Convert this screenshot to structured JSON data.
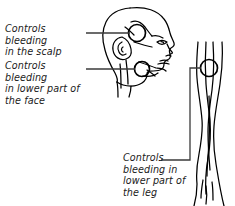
{
  "figure": {
    "ink_color": "#000000",
    "text_color": "#1a1a1a",
    "background": "#ffffff"
  },
  "callouts": [
    {
      "id": "scalp",
      "text": "Controls bleeding\nin the scalp",
      "target": "temporal-pressure-point"
    },
    {
      "id": "face",
      "text": "Controls bleeding\nin lower part of\nthe face",
      "target": "facial-pressure-point"
    },
    {
      "id": "leg",
      "text": "Controls\nbleeding in\nlower part of\nthe leg",
      "target": "popliteal-pressure-point"
    }
  ],
  "markers": [
    {
      "id": "temporal-pressure-point",
      "cx": 137,
      "cy": 33,
      "r": 8.5
    },
    {
      "id": "facial-pressure-point",
      "cx": 142,
      "cy": 69,
      "r": 7.5
    },
    {
      "id": "popliteal-pressure-point",
      "cx": 209,
      "cy": 68,
      "r": 8.5
    }
  ],
  "leaders": [
    {
      "id": "leader-scalp",
      "points": "86,33 130,33"
    },
    {
      "id": "leader-face",
      "points": "86,69 135,69"
    },
    {
      "id": "leader-leg",
      "points": "161,160 190,160 190,68 201,68"
    }
  ]
}
